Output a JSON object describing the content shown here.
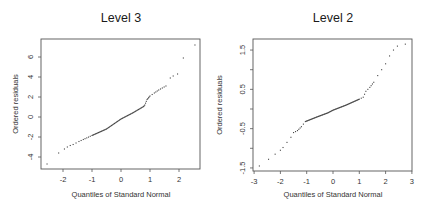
{
  "chart_data": [
    {
      "type": "scatter",
      "title": "Level 3",
      "xlabel": "Quantiles of Standard Normal",
      "ylabel": "Ordered residuals",
      "xlim": [
        -2.75,
        2.75
      ],
      "ylim": [
        -5.2,
        7.8
      ],
      "xticks": [
        -2,
        -1,
        0,
        1,
        2
      ],
      "yticks": [
        -4,
        -2,
        0,
        2,
        4,
        6
      ],
      "grid": false,
      "legend": null,
      "frame": {
        "left": 41,
        "right": 200,
        "top": 39,
        "bottom": 169
      },
      "scale": {
        "x0": 121,
        "xs": 29,
        "y0": 117,
        "ys": 10
      },
      "anchors": [
        [
          -2.55,
          -4.7
        ],
        [
          -2.15,
          -3.6
        ],
        [
          -1.95,
          -3.2
        ],
        [
          -1.85,
          -3.0
        ],
        [
          -1.75,
          -2.85
        ],
        [
          -1.65,
          -2.75
        ],
        [
          -1.55,
          -2.6
        ],
        [
          -1.45,
          -2.45
        ],
        [
          -1.3,
          -2.25
        ],
        [
          -1.0,
          -1.85
        ],
        [
          -0.5,
          -1.2
        ],
        [
          0.0,
          -0.2
        ],
        [
          0.4,
          0.4
        ],
        [
          0.78,
          1.05
        ],
        [
          0.82,
          1.2
        ],
        [
          0.9,
          1.75
        ],
        [
          1.0,
          2.1
        ],
        [
          1.15,
          2.4
        ],
        [
          1.3,
          2.7
        ],
        [
          1.55,
          3.1
        ],
        [
          1.7,
          3.9
        ],
        [
          1.8,
          4.1
        ],
        [
          1.95,
          4.3
        ],
        [
          2.15,
          5.9
        ],
        [
          2.55,
          7.2
        ]
      ]
    },
    {
      "type": "scatter",
      "title": "Level 2",
      "xlabel": "Quantiles of Standard Normal",
      "ylabel": "Ordered residuals",
      "xlim": [
        -3,
        3
      ],
      "ylim": [
        -1.65,
        1.75
      ],
      "xticks": [
        -3,
        -2,
        -1,
        0,
        1,
        2,
        3
      ],
      "yticks": [
        -1.5,
        -1.0,
        -0.5,
        0.0,
        0.5,
        1.0,
        1.5
      ],
      "ytick_labels": [
        "-1.5",
        "",
        "-0.5",
        "",
        "0.5",
        "",
        "1.5"
      ],
      "grid": false,
      "legend": null,
      "frame": {
        "left": 253,
        "right": 412,
        "top": 39,
        "bottom": 171
      },
      "scale": {
        "x0": 333,
        "xs": 26.3,
        "y0": 109,
        "ys": 39.3
      },
      "anchors": [
        [
          -2.8,
          -1.45
        ],
        [
          -2.45,
          -1.28
        ],
        [
          -2.2,
          -1.15
        ],
        [
          -2.0,
          -1.05
        ],
        [
          -1.9,
          -0.98
        ],
        [
          -1.75,
          -0.85
        ],
        [
          -1.6,
          -0.72
        ],
        [
          -1.5,
          -0.6
        ],
        [
          -1.35,
          -0.55
        ],
        [
          -1.2,
          -0.45
        ],
        [
          -1.05,
          -0.32
        ],
        [
          -0.6,
          -0.2
        ],
        [
          -0.2,
          -0.1
        ],
        [
          0.0,
          -0.03
        ],
        [
          0.5,
          0.1
        ],
        [
          1.0,
          0.25
        ],
        [
          1.15,
          0.3
        ],
        [
          1.25,
          0.45
        ],
        [
          1.4,
          0.55
        ],
        [
          1.55,
          0.68
        ],
        [
          1.7,
          0.85
        ],
        [
          1.85,
          1.0
        ],
        [
          2.0,
          1.15
        ],
        [
          2.15,
          1.35
        ],
        [
          2.3,
          1.5
        ],
        [
          2.45,
          1.6
        ],
        [
          2.75,
          1.65
        ]
      ]
    }
  ]
}
